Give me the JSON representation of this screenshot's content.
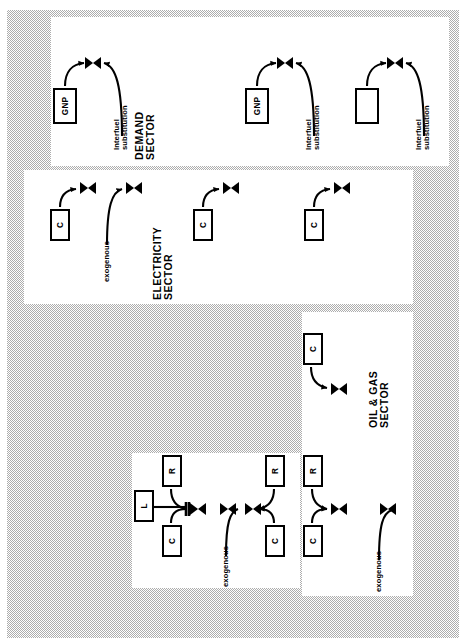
{
  "figure": {
    "orientation": "rotated-90-ccw",
    "background_color": "#8e8e8e",
    "panel_color": "#ffffff",
    "stroke_color": "#000000",
    "type": "system-dynamics-stock-flow-diagram"
  },
  "panels": [
    {
      "id": "demand",
      "title": "DEMAND\nSECTOR"
    },
    {
      "id": "electricity",
      "title": "ELECTRICITY\nSECTOR"
    },
    {
      "id": "oilgas",
      "title": "OIL & GAS\nSECTOR"
    },
    {
      "id": "resource",
      "title": ""
    }
  ],
  "labels": {
    "gnp": "GNP",
    "c": "C",
    "r": "R",
    "l": "L",
    "blank": "",
    "interfuel_substitution": "Interfuel\nsubstitution",
    "exogenous": "exogenous"
  },
  "demand_sector": {
    "title": "DEMAND\nSECTOR",
    "units": [
      {
        "box": "GNP",
        "flow_label": "Interfuel\nsubstitution"
      },
      {
        "box": "GNP",
        "flow_label": "Interfuel\nsubstitution"
      },
      {
        "box": "",
        "flow_label": "Interfuel\nsubstitution"
      }
    ]
  },
  "electricity_sector": {
    "title": "ELECTRICITY\nSECTOR",
    "units": [
      {
        "box": "C",
        "flow_label": ""
      },
      {
        "box": "",
        "flow_label": "exogenous"
      },
      {
        "box": "C",
        "flow_label": ""
      },
      {
        "box": "C",
        "flow_label": ""
      }
    ]
  },
  "oilgas_sector": {
    "title": "OIL & GAS\nSECTOR",
    "units": [
      {
        "box": "C",
        "flow_label": ""
      },
      {
        "boxes": [
          "R",
          "C"
        ],
        "flow_label": ""
      },
      {
        "box": "",
        "flow_label": "exogenous"
      }
    ]
  },
  "resource_sector": {
    "title": "",
    "units": [
      {
        "boxes": [
          "R",
          "L",
          "C"
        ],
        "flow_label": "exogenous"
      },
      {
        "boxes": [
          "R",
          "C"
        ],
        "flow_label": ""
      }
    ]
  },
  "boxes": [
    {
      "name": "demand-gnp-1",
      "label": "GNP",
      "x": 53,
      "y": 88,
      "w": 24,
      "h": 36
    },
    {
      "name": "demand-gnp-2",
      "label": "GNP",
      "x": 245,
      "y": 88,
      "w": 24,
      "h": 36
    },
    {
      "name": "demand-blank",
      "label": "",
      "x": 355,
      "y": 88,
      "w": 24,
      "h": 36
    },
    {
      "name": "elec-c-1",
      "label": "C",
      "x": 50,
      "y": 209,
      "w": 20,
      "h": 32
    },
    {
      "name": "elec-c-2",
      "label": "C",
      "x": 193,
      "y": 209,
      "w": 20,
      "h": 32
    },
    {
      "name": "elec-c-3",
      "label": "C",
      "x": 304,
      "y": 209,
      "w": 20,
      "h": 32
    },
    {
      "name": "oilgas-c-1",
      "label": "C",
      "x": 303,
      "y": 333,
      "w": 20,
      "h": 32
    },
    {
      "name": "res-r-1",
      "label": "R",
      "x": 162,
      "y": 455,
      "w": 20,
      "h": 32
    },
    {
      "name": "res-l-1",
      "label": "L",
      "x": 134,
      "y": 490,
      "w": 20,
      "h": 32
    },
    {
      "name": "res-c-1",
      "label": "C",
      "x": 162,
      "y": 525,
      "w": 20,
      "h": 32
    },
    {
      "name": "res-r-2",
      "label": "R",
      "x": 265,
      "y": 455,
      "w": 20,
      "h": 32
    },
    {
      "name": "res-c-2",
      "label": "C",
      "x": 265,
      "y": 525,
      "w": 20,
      "h": 32
    },
    {
      "name": "oilgas-r-2",
      "label": "R",
      "x": 303,
      "y": 455,
      "w": 20,
      "h": 32
    },
    {
      "name": "oilgas-c-2",
      "label": "C",
      "x": 303,
      "y": 525,
      "w": 20,
      "h": 32
    }
  ]
}
